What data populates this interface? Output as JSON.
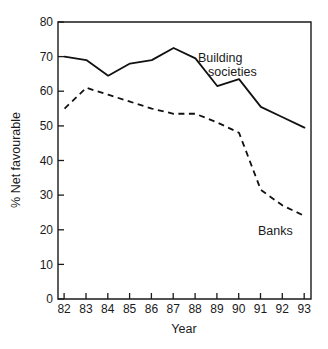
{
  "chart_data": {
    "type": "line",
    "title": "",
    "xlabel": "Year",
    "ylabel": "% Net favourable",
    "categories": [
      "82",
      "83",
      "84",
      "85",
      "86",
      "87",
      "88",
      "89",
      "90",
      "91",
      "92",
      "93"
    ],
    "x": [
      82,
      83,
      84,
      85,
      86,
      87,
      88,
      89,
      90,
      91,
      92,
      93
    ],
    "xlim": [
      81.7,
      93.3
    ],
    "ylim": [
      0,
      80
    ],
    "ytick_labels": [
      "0",
      "10",
      "20",
      "30",
      "40",
      "50",
      "60",
      "70",
      "80"
    ],
    "yticks": [
      0,
      10,
      20,
      30,
      40,
      50,
      60,
      70,
      80
    ],
    "grid": false,
    "legend_position": "inline-annotation",
    "series": [
      {
        "name": "Building societies",
        "style": "solid",
        "color": "#111111",
        "values": [
          70.0,
          69.0,
          64.5,
          68.0,
          69.0,
          72.5,
          69.5,
          61.5,
          63.5,
          55.5,
          52.5,
          49.5
        ]
      },
      {
        "name": "Banks",
        "style": "dashed",
        "color": "#111111",
        "values": [
          55.0,
          61.0,
          59.0,
          57.0,
          55.0,
          53.5,
          53.5,
          51.0,
          48.0,
          31.5,
          27.0,
          24.0
        ]
      }
    ],
    "annotations": [
      {
        "name": "building-societies",
        "text_lines": [
          "Building",
          "societies"
        ]
      },
      {
        "name": "banks",
        "text_lines": [
          "Banks"
        ]
      }
    ]
  }
}
